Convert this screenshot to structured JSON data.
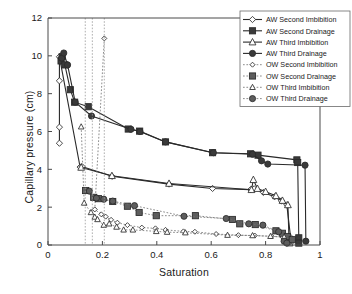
{
  "chart_data": {
    "type": "line",
    "title": "",
    "xlabel": "Saturation",
    "ylabel": "Capillary pressure (cm)",
    "xlim": [
      0,
      1
    ],
    "ylim": [
      0,
      12
    ],
    "xticks": [
      "0",
      "0.2",
      "0.4",
      "0.6",
      "0.8",
      "1"
    ],
    "xtick_values": [
      0,
      0.2,
      0.4,
      0.6,
      0.8,
      1.0
    ],
    "yticks": [
      "0",
      "2",
      "4",
      "6",
      "8",
      "10",
      "12"
    ],
    "ytick_values": [
      0,
      2,
      4,
      6,
      8,
      10,
      12
    ],
    "grid": false,
    "legend_position": "top-right",
    "vertical_guide_lines": [
      0.137,
      0.163,
      0.207
    ],
    "series": [
      {
        "name": "AW Second Imbibition",
        "marker": "diamond-open",
        "line": "solid",
        "points": [
          [
            0.042,
            5.38
          ],
          [
            0.042,
            6.23
          ],
          [
            0.042,
            8.68
          ],
          [
            0.042,
            9.95
          ],
          [
            0.118,
            4.12
          ],
          [
            0.125,
            4.15
          ],
          [
            0.235,
            3.63
          ],
          [
            0.445,
            3.22
          ],
          [
            0.605,
            2.99
          ],
          [
            0.745,
            2.93
          ],
          [
            0.758,
            2.97
          ],
          [
            0.792,
            2.78
          ],
          [
            0.833,
            2.55
          ],
          [
            0.858,
            2.33
          ],
          [
            0.878,
            2.12
          ],
          [
            0.892,
            0.4
          ],
          [
            0.892,
            0.12
          ]
        ]
      },
      {
        "name": "AW Second Drainage",
        "marker": "square-filled",
        "line": "solid",
        "points": [
          [
            0.048,
            9.73
          ],
          [
            0.052,
            9.95
          ],
          [
            0.062,
            9.52
          ],
          [
            0.082,
            8.21
          ],
          [
            0.098,
            7.55
          ],
          [
            0.148,
            7.31
          ],
          [
            0.295,
            6.13
          ],
          [
            0.337,
            6.02
          ],
          [
            0.432,
            5.45
          ],
          [
            0.605,
            4.88
          ],
          [
            0.745,
            4.82
          ],
          [
            0.772,
            4.75
          ],
          [
            0.915,
            4.5
          ],
          [
            0.918,
            4.36
          ],
          [
            0.922,
            0.38
          ],
          [
            0.922,
            0.1
          ]
        ]
      },
      {
        "name": "AW Third Imbibition",
        "marker": "triangle-open",
        "line": "solid",
        "points": [
          [
            0.122,
            4.1
          ],
          [
            0.235,
            3.66
          ],
          [
            0.445,
            3.25
          ],
          [
            0.748,
            2.92
          ],
          [
            0.755,
            3.45
          ],
          [
            0.77,
            2.98
          ],
          [
            0.8,
            2.82
          ],
          [
            0.838,
            2.6
          ],
          [
            0.862,
            2.35
          ],
          [
            0.882,
            2.12
          ],
          [
            0.886,
            0.3
          ],
          [
            0.888,
            0.1
          ]
        ]
      },
      {
        "name": "AW Third Drainage",
        "marker": "circle-filled",
        "line": "solid",
        "points": [
          [
            0.05,
            9.88
          ],
          [
            0.058,
            10.15
          ],
          [
            0.072,
            9.52
          ],
          [
            0.1,
            7.55
          ],
          [
            0.16,
            6.82
          ],
          [
            0.305,
            6.12
          ],
          [
            0.338,
            6.0
          ],
          [
            0.432,
            5.45
          ],
          [
            0.608,
            4.88
          ],
          [
            0.752,
            4.8
          ],
          [
            0.785,
            4.45
          ],
          [
            0.808,
            4.28
          ],
          [
            0.945,
            4.22
          ],
          [
            0.948,
            0.2
          ]
        ]
      },
      {
        "name": "OW Second Imbibition",
        "marker": "diamond-open-small",
        "line": "dotted",
        "points": [
          [
            0.207,
            10.92
          ],
          [
            0.172,
            1.88
          ],
          [
            0.196,
            1.62
          ],
          [
            0.212,
            1.5
          ],
          [
            0.232,
            1.33
          ],
          [
            0.255,
            1.18
          ],
          [
            0.292,
            1.05
          ],
          [
            0.345,
            0.92
          ],
          [
            0.395,
            0.88
          ],
          [
            0.432,
            0.8
          ],
          [
            0.498,
            0.72
          ],
          [
            0.54,
            0.7
          ],
          [
            0.618,
            0.58
          ],
          [
            0.7,
            0.52
          ],
          [
            0.76,
            0.5
          ],
          [
            0.822,
            0.46
          ],
          [
            0.862,
            0.42
          ],
          [
            0.888,
            0.22
          ]
        ]
      },
      {
        "name": "OW Second Drainage",
        "marker": "square-filled-gray",
        "line": "dotted",
        "points": [
          [
            0.138,
            2.88
          ],
          [
            0.168,
            2.52
          ],
          [
            0.185,
            2.45
          ],
          [
            0.238,
            2.3
          ],
          [
            0.292,
            2.05
          ],
          [
            0.335,
            1.72
          ],
          [
            0.398,
            1.55
          ],
          [
            0.542,
            1.55
          ],
          [
            0.678,
            1.35
          ],
          [
            0.705,
            1.12
          ],
          [
            0.762,
            1.08
          ],
          [
            0.838,
            0.75
          ],
          [
            0.862,
            0.62
          ],
          [
            0.88,
            0.45
          ],
          [
            0.898,
            0.28
          ]
        ]
      },
      {
        "name": "OW Third Imbibition",
        "marker": "triangle-open-small",
        "line": "dotted",
        "points": [
          [
            0.122,
            6.25
          ],
          [
            0.133,
            2.22
          ],
          [
            0.158,
            1.72
          ],
          [
            0.172,
            1.48
          ],
          [
            0.182,
            1.35
          ],
          [
            0.205,
            1.05
          ],
          [
            0.225,
            1.12
          ],
          [
            0.252,
            0.95
          ],
          [
            0.278,
            0.8
          ],
          [
            0.312,
            0.8
          ],
          [
            0.398,
            0.72
          ],
          [
            0.438,
            0.68
          ],
          [
            0.505,
            0.65
          ],
          [
            0.66,
            0.52
          ],
          [
            0.752,
            0.5
          ],
          [
            0.818,
            0.46
          ],
          [
            0.868,
            0.42
          ],
          [
            0.882,
            0.15
          ]
        ]
      },
      {
        "name": "OW Third Drainage",
        "marker": "circle-filled-gray",
        "line": "dotted",
        "points": [
          [
            0.152,
            2.85
          ],
          [
            0.178,
            2.48
          ],
          [
            0.205,
            2.42
          ],
          [
            0.238,
            2.32
          ],
          [
            0.318,
            2.08
          ],
          [
            0.5,
            1.52
          ],
          [
            0.655,
            1.4
          ],
          [
            0.738,
            1.12
          ],
          [
            0.79,
            1.05
          ],
          [
            0.848,
            0.7
          ],
          [
            0.868,
            0.2
          ],
          [
            0.878,
            0.1
          ]
        ]
      }
    ]
  },
  "axes": {
    "x_label": "Saturation",
    "y_label": "Capillary pressure (cm)"
  },
  "legend": {
    "items": [
      {
        "label": "AW Second Imbibition"
      },
      {
        "label": "AW Second Drainage"
      },
      {
        "label": "AW Third Imbibition"
      },
      {
        "label": "AW Third Drainage"
      },
      {
        "label": "OW Second Imbibition"
      },
      {
        "label": "OW Second Drainage"
      },
      {
        "label": "OW Third Imbibition"
      },
      {
        "label": "OW Third Drainage"
      }
    ]
  },
  "colors": {
    "axis": "#4a4a4a",
    "solid_series": "#2a2a2a",
    "dotted_series": "#6f6f6f",
    "marker_fill": "#5d5d5d",
    "background": "#ffffff"
  }
}
